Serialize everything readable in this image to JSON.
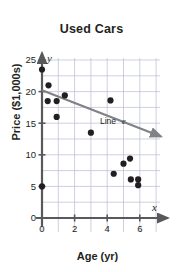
{
  "chart_data": {
    "type": "scatter",
    "title": "Used Cars",
    "xlabel": "Age (yr)",
    "ylabel": "Price ($1,000s)",
    "xlim": [
      0,
      7.5
    ],
    "ylim": [
      0,
      27
    ],
    "xticks": [
      0,
      2,
      4,
      6
    ],
    "xtick_labels": [
      "0",
      "2",
      "4",
      "6"
    ],
    "yticks": [
      0,
      5,
      10,
      15,
      20,
      25
    ],
    "ytick_labels": [
      "0",
      "5",
      "10",
      "15",
      "20",
      "25"
    ],
    "grid": true,
    "grid_x_step": 1,
    "grid_y_step": 2.5,
    "grid_color": "#b9bcd4",
    "axis_color": "#58595b",
    "point_color": "#231f20",
    "trendline_color": "#808285",
    "x_axis_var": "x",
    "y_axis_var": "y",
    "points": [
      {
        "x": 0.0,
        "y": 23.5
      },
      {
        "x": 0.0,
        "y": 5.0
      },
      {
        "x": 0.4,
        "y": 21.0
      },
      {
        "x": 0.35,
        "y": 18.5
      },
      {
        "x": 0.9,
        "y": 18.5
      },
      {
        "x": 0.9,
        "y": 16.0
      },
      {
        "x": 1.4,
        "y": 19.4
      },
      {
        "x": 3.0,
        "y": 13.5
      },
      {
        "x": 4.2,
        "y": 18.6
      },
      {
        "x": 4.4,
        "y": 7.0
      },
      {
        "x": 5.0,
        "y": 8.6
      },
      {
        "x": 5.4,
        "y": 9.4
      },
      {
        "x": 5.45,
        "y": 6.1
      },
      {
        "x": 5.9,
        "y": 6.1
      },
      {
        "x": 5.9,
        "y": 5.2
      }
    ],
    "trendline": {
      "label": "Line e",
      "label_text": "Line",
      "label_var": "e",
      "x_start": 0.0,
      "y_start": 20.2,
      "x_end": 7.3,
      "y_end": 12.9,
      "arrow_end": true
    }
  }
}
